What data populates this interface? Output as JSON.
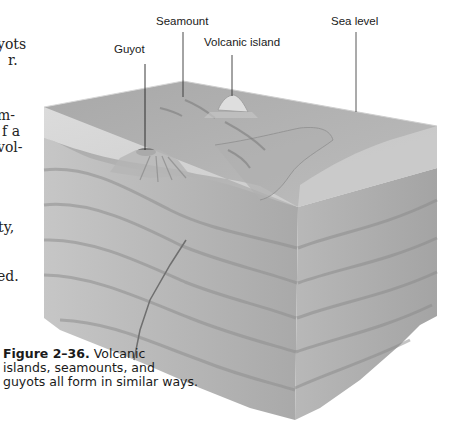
{
  "body_text_fragments": [
    {
      "text": "yots",
      "top": 44
    },
    {
      "text": "r.",
      "top": 60
    },
    {
      "text": "m-",
      "top": 113
    },
    {
      "text": "f a",
      "top": 129
    },
    {
      "text": "vol-",
      "top": 145
    },
    {
      "text": "ty,",
      "top": 226
    },
    {
      "text": "ed.",
      "top": 275
    }
  ],
  "figure": {
    "labels": {
      "seamount": "Seamount",
      "sea_level": "Sea level",
      "guyot": "Guyot",
      "volcanic_island": "Volcanic island"
    },
    "caption": {
      "number": "Figure 2–36.",
      "line1": "Volcanic",
      "line2": "islands, seamounts, and",
      "line3": "guyots all form in similar ways."
    }
  }
}
